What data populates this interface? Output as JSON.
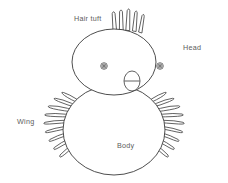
{
  "diagram": {
    "background_color": "#ffffff",
    "stroke_color": "#3a3a3a",
    "label_color": "#5c5c5c",
    "stroke_width": 0.8,
    "labels": [
      {
        "id": "hair-tuft",
        "text": "Hair tuft",
        "x": 74,
        "y": 15
      },
      {
        "id": "head",
        "text": "Head",
        "x": 183,
        "y": 44
      },
      {
        "id": "wing",
        "text": "Wing",
        "x": 17,
        "y": 118
      },
      {
        "id": "body",
        "text": "Body",
        "x": 117,
        "y": 142
      }
    ],
    "parts": {
      "head": {
        "name": "head-outline",
        "shape": "ellipse",
        "cx": 114,
        "cy": 62,
        "rx": 42,
        "ry": 33
      },
      "body": {
        "name": "body-outline",
        "shape": "ellipse",
        "cx": 114,
        "cy": 130,
        "rx": 51,
        "ry": 45
      },
      "beak": {
        "name": "beak",
        "shape": "ellipse",
        "cx": 132,
        "cy": 81,
        "rx": 8,
        "ry": 10
      },
      "eye_left": {
        "name": "eye-left",
        "shape": "concentric-circle",
        "cx": 104,
        "cy": 66,
        "r": 3.2
      },
      "eye_right": {
        "name": "eye-right",
        "shape": "concentric-circle",
        "cx": 160,
        "cy": 66,
        "r": 3.2
      },
      "hair_tuft": {
        "name": "hair-tuft",
        "spike_count": 5
      },
      "wing_left": {
        "name": "wing-left",
        "feather_count": 9
      },
      "wing_right": {
        "name": "wing-right",
        "feather_count": 9
      }
    }
  }
}
